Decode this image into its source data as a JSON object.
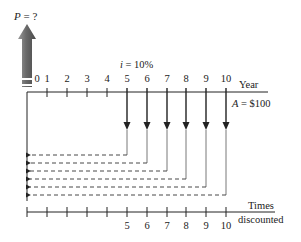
{
  "diagram": {
    "present_value_label_var": "P",
    "present_value_label_rest": " = ?",
    "interest_label_var": "i",
    "interest_label_rest": " = 10%",
    "top_axis_label": "Year",
    "annuity_label_var": "A",
    "annuity_label_rest": " = $100",
    "bottom_axis_label_line1": "Times",
    "bottom_axis_label_line2": "discounted",
    "year_ticks": [
      "0",
      "1",
      "2",
      "3",
      "4",
      "5",
      "6",
      "7",
      "8",
      "9",
      "10"
    ],
    "times_discounted_ticks": [
      "5",
      "6",
      "7",
      "8",
      "9",
      "10"
    ],
    "cash_flow_years": [
      5,
      6,
      7,
      8,
      9,
      10
    ],
    "cash_flow_amount": 100,
    "interest_rate_percent": 10,
    "colors": {
      "line": "#222222",
      "arrow_gray": "#6e6e6e",
      "dashed": "#333333"
    }
  }
}
